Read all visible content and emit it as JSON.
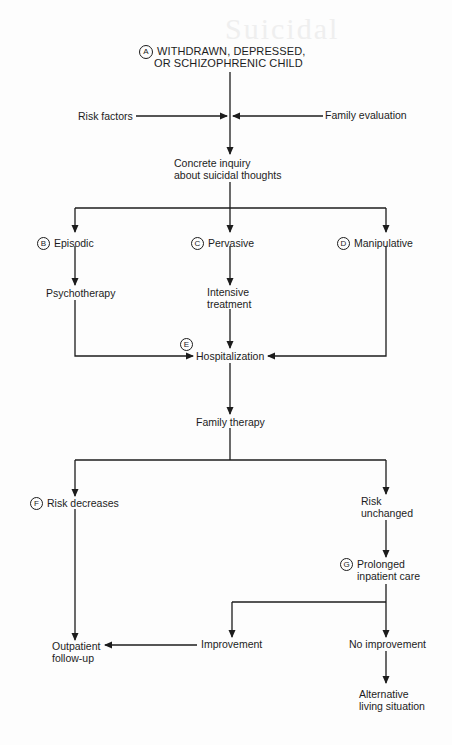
{
  "diagram": {
    "type": "flowchart",
    "ghost_text": "Suicidal",
    "colors": {
      "ink": "#1c1c1c",
      "background": "#fdfdfd"
    },
    "nodes": {
      "A": {
        "marker": "A",
        "lines": [
          "WITHDRAWN, DEPRESSED,",
          "OR SCHIZOPHRENIC CHILD"
        ]
      },
      "risk_factors": {
        "text": "Risk factors"
      },
      "family_evaluation": {
        "text": "Family evaluation"
      },
      "concrete_inquiry": {
        "lines": [
          "Concrete inquiry",
          "about suicidal thoughts"
        ]
      },
      "B": {
        "marker": "B",
        "text": "Episodic"
      },
      "C": {
        "marker": "C",
        "text": "Pervasive"
      },
      "D": {
        "marker": "D",
        "text": "Manipulative"
      },
      "psychotherapy": {
        "text": "Psychotherapy"
      },
      "intensive_treatment": {
        "lines": [
          "Intensive",
          "treatment"
        ]
      },
      "E": {
        "marker": "E",
        "text": "Hospitalization"
      },
      "family_therapy": {
        "text": "Family therapy"
      },
      "F": {
        "marker": "F",
        "text": "Risk decreases"
      },
      "risk_unchanged": {
        "lines": [
          "Risk",
          "unchanged"
        ]
      },
      "G": {
        "marker": "G",
        "lines": [
          "Prolonged",
          "inpatient care"
        ]
      },
      "improvement": {
        "text": "Improvement"
      },
      "no_improvement": {
        "text": "No improvement"
      },
      "outpatient": {
        "lines": [
          "Outpatient",
          "follow-up"
        ]
      },
      "alternative": {
        "lines": [
          "Alternative",
          "living situation"
        ]
      }
    },
    "edges": [
      [
        "A",
        "concrete_inquiry"
      ],
      [
        "risk_factors",
        "concrete_inquiry"
      ],
      [
        "family_evaluation",
        "concrete_inquiry"
      ],
      [
        "concrete_inquiry",
        "B"
      ],
      [
        "concrete_inquiry",
        "C"
      ],
      [
        "concrete_inquiry",
        "D"
      ],
      [
        "B",
        "psychotherapy"
      ],
      [
        "C",
        "intensive_treatment"
      ],
      [
        "psychotherapy",
        "E"
      ],
      [
        "intensive_treatment",
        "E"
      ],
      [
        "D",
        "E"
      ],
      [
        "E",
        "family_therapy"
      ],
      [
        "family_therapy",
        "F"
      ],
      [
        "family_therapy",
        "risk_unchanged"
      ],
      [
        "F",
        "outpatient"
      ],
      [
        "risk_unchanged",
        "G"
      ],
      [
        "G",
        "improvement"
      ],
      [
        "G",
        "no_improvement"
      ],
      [
        "improvement",
        "outpatient"
      ],
      [
        "no_improvement",
        "alternative"
      ]
    ]
  }
}
